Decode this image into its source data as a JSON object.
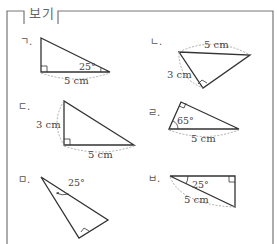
{
  "box": {
    "title": "보기"
  },
  "colors": {
    "frame": "#777777",
    "line": "#333333",
    "dashed": "#999999",
    "text": "#444444"
  },
  "items": [
    {
      "label": "ㄱ.",
      "angle": "25°",
      "side": "5 cm"
    },
    {
      "label": "ㄴ.",
      "hyp": "5 cm",
      "leg": "3 cm"
    },
    {
      "label": "ㄷ.",
      "leg_vertical": "3 cm",
      "leg_horizontal": "5 cm"
    },
    {
      "label": "ㄹ.",
      "angle": "65°",
      "hyp": "5 cm"
    },
    {
      "label": "ㅁ.",
      "angle": "25°"
    },
    {
      "label": "ㅂ.",
      "angle": "25°",
      "hyp": "5 cm"
    }
  ]
}
